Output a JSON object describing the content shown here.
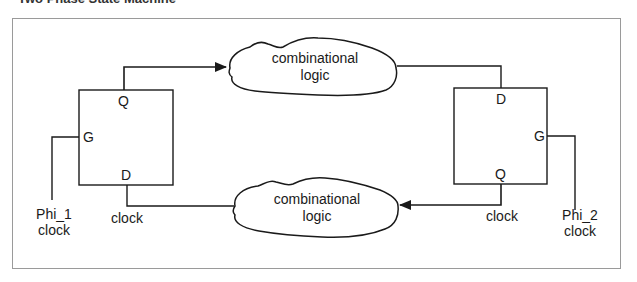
{
  "title": "Two Phase State Machine",
  "diagram": {
    "latch_left": {
      "pins": {
        "top": "Q",
        "side": "G",
        "bottom": "D"
      },
      "clock_label": {
        "line1": "Phi_1",
        "line2": "clock"
      },
      "wire_label": "clock"
    },
    "latch_right": {
      "pins": {
        "top": "D",
        "side": "G",
        "bottom": "Q"
      },
      "clock_label": {
        "line1": "Phi_2",
        "line2": "clock"
      },
      "wire_label": "clock"
    },
    "cloud_top": {
      "line1": "combinational",
      "line2": "logic"
    },
    "cloud_bottom": {
      "line1": "combinational",
      "line2": "logic"
    },
    "colors": {
      "stroke": "#1a1a1a",
      "frame": "#9a9a9a",
      "background": "#ffffff"
    }
  }
}
